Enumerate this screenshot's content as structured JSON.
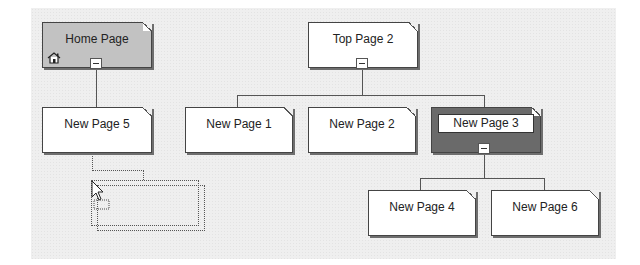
{
  "diagram": {
    "type": "site-map",
    "nodes": [
      {
        "id": "home",
        "label": "Home Page",
        "kind": "home",
        "icon": "home-icon"
      },
      {
        "id": "np5",
        "label": "New Page 5",
        "parent": "home"
      },
      {
        "id": "top2",
        "label": "Top Page 2",
        "kind": "top"
      },
      {
        "id": "np1",
        "label": "New Page 1",
        "parent": "top2"
      },
      {
        "id": "np2",
        "label": "New Page 2",
        "parent": "top2"
      },
      {
        "id": "np3",
        "label": "New Page 3",
        "parent": "top2",
        "selected": true
      },
      {
        "id": "np4",
        "label": "New Page 4",
        "parent": "np3"
      },
      {
        "id": "np6",
        "label": "New Page 6",
        "parent": "np3"
      }
    ],
    "drag_state": {
      "dragging": true,
      "ghost_target_parent": "np5"
    }
  },
  "colors": {
    "canvas": "#efefef",
    "page_fill": "#ffffff",
    "home_fill": "#c2c2c2",
    "selected_fill": "#6a6a6a",
    "line": "#555555"
  }
}
